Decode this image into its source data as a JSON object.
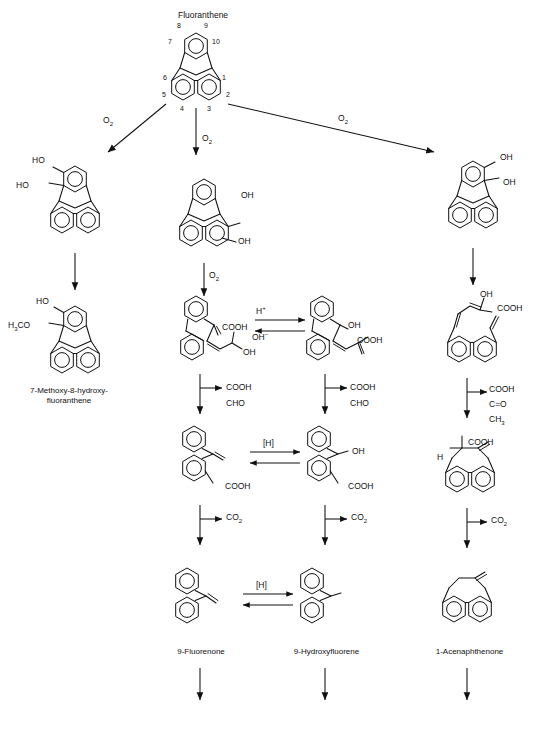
{
  "diagram": {
    "parent_compound": "Fluoranthene",
    "ring_position_numbers": [
      "1",
      "2",
      "3",
      "4",
      "5",
      "6",
      "7",
      "8",
      "9",
      "10"
    ],
    "reagent_labels": {
      "oxygen": "O2",
      "carbon_dioxide": "CO2",
      "hydride": "[H]",
      "proton": "H+",
      "hydroxide": "OH-"
    },
    "branches": [
      {
        "id": "left",
        "oxygen_label": "O2",
        "intermediate_substituents": [
          "HO",
          "HO"
        ],
        "product_name_line1": "7-Methoxy-8-hydroxy-",
        "product_name_line2": "fluoranthene",
        "product_substituents": [
          "HO",
          "H3CO"
        ]
      },
      {
        "id": "middle-left",
        "oxygen_label": "O2",
        "second_oxygen_label": "O2",
        "diol_substituents": [
          "OH",
          "OH"
        ],
        "ketoacid_substituents": [
          "COOH",
          "OH"
        ],
        "side_product_lines": [
          "COOH",
          "CHO"
        ],
        "acid_substituent": "COOH",
        "co2_label": "CO2",
        "product_name": "9-Fluorenone"
      },
      {
        "id": "middle-right",
        "hydroxy_substituents": [
          "OH",
          "COOH"
        ],
        "side_product_lines": [
          "COOH",
          "CHO"
        ],
        "acid_substituents": [
          "OH",
          "COOH"
        ],
        "co2_label": "CO2",
        "product_name": "9-Hydroxyfluorene"
      },
      {
        "id": "right",
        "oxygen_label": "O2",
        "diol_substituents": [
          "OH",
          "OH"
        ],
        "enol_substituents": [
          "OH",
          "COOH"
        ],
        "side_product_lines": [
          "COOH",
          "C=O",
          "CH3"
        ],
        "acid_substituents": [
          "COOH",
          "H"
        ],
        "co2_label": "CO2",
        "product_name": "1-Acenaphthenone"
      }
    ],
    "equilibria": [
      {
        "top": "H+",
        "bottom": "OH-"
      },
      {
        "top": "[H]",
        "bottom": ""
      },
      {
        "top": "[H]",
        "bottom": ""
      }
    ]
  }
}
